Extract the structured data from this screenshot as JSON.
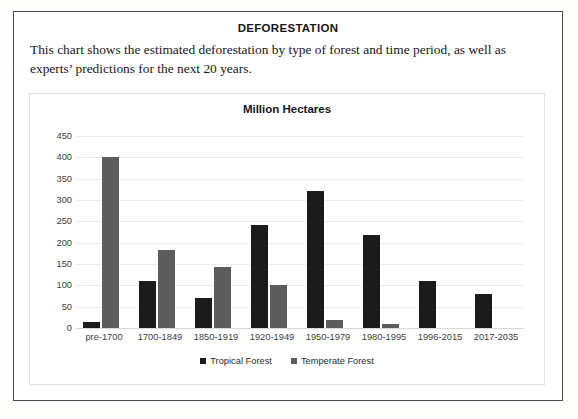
{
  "document": {
    "title": "DEFORESTATION",
    "description": "This chart shows the estimated deforestation by type of forest and time period, as well as experts’ predictions for the next 20 years."
  },
  "chart_data": {
    "type": "bar",
    "title": "Million Hectares",
    "xlabel": "",
    "ylabel": "",
    "ylim": [
      0,
      450
    ],
    "ytick_step": 50,
    "yticks": [
      450,
      400,
      350,
      300,
      250,
      200,
      150,
      100,
      50,
      0
    ],
    "grid": true,
    "legend_position": "bottom",
    "categories": [
      "pre-1700",
      "1700-1849",
      "1850-1919",
      "1920-1949",
      "1950-1979",
      "1980-1995",
      "1996-2015",
      "2017-2035"
    ],
    "series": [
      {
        "name": "Tropical Forest",
        "color": "#1b1b1b",
        "values": [
          13,
          110,
          70,
          242,
          320,
          218,
          110,
          80
        ]
      },
      {
        "name": "Temperate Forest",
        "color": "#5c5c5c",
        "values": [
          400,
          183,
          143,
          101,
          19,
          10,
          0,
          0
        ]
      }
    ]
  },
  "colors": {
    "tropical_forest": "#1b1b1b",
    "temperate_forest": "#5c5c5c",
    "gridline": "#ededed",
    "card_border": "#4a4a4a",
    "panel_border": "#e2e2e2",
    "text": "#16161a"
  }
}
